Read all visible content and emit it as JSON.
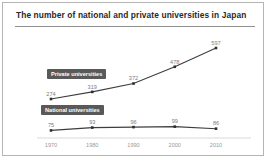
{
  "window": {
    "title": "The number of national and private universities in Japan"
  },
  "chart_data": {
    "type": "line",
    "title": "The number of national and private universities in Japan",
    "xlabel": "",
    "ylabel": "",
    "categories": [
      "1970",
      "1980",
      "1990",
      "2000",
      "2010"
    ],
    "series": [
      {
        "name": "Private universities",
        "values": [
          274,
          319,
          372,
          478,
          597
        ]
      },
      {
        "name": "National universities",
        "values": [
          75,
          93,
          96,
          99,
          86
        ]
      }
    ],
    "ylim": [
      0,
      650
    ],
    "grid": false,
    "legend_position": "inline-boxed-labels",
    "colors": {
      "line": "#3e3e3e",
      "marker": "#2e2e2e",
      "label_box_bg": "#595959",
      "label_box_text": "#ffffff",
      "value_label": "#7d7d7d",
      "tick_label": "#9a9a9a",
      "axis_line": "#d9d9d9",
      "title_text": "#2a2a2a",
      "border": "#b5b5b5"
    }
  }
}
